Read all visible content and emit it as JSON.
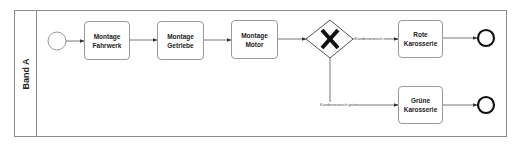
{
  "pool": {
    "lane_label": "Band A"
  },
  "events": {
    "start": {
      "type": "start-event"
    },
    "end_rot": {
      "type": "end-event"
    },
    "end_gruen": {
      "type": "end-event"
    }
  },
  "tasks": [
    {
      "line1": "Montage",
      "line2": "Fahrwerk"
    },
    {
      "line1": "Montage",
      "line2": "Getriebe"
    },
    {
      "line1": "Montage",
      "line2": "Motor"
    },
    {
      "line1": "Rote",
      "line2": "Karosserie"
    },
    {
      "line1": "Grüne",
      "line2": "Karosserie"
    }
  ],
  "gateway": {
    "type": "exclusive-gateway",
    "symbol": "X"
  },
  "edge_labels": {
    "rot": "Kundenwunsch rot",
    "gruen": "Kundenwunsch grün"
  },
  "colors": {
    "stroke": "#555555",
    "border": "#8a8a8a",
    "text": "#222222"
  }
}
